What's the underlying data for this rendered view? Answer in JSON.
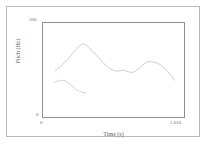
{
  "chart_data": {
    "type": "line",
    "title": "",
    "subtitle": "",
    "xlabel": "Time (s)",
    "ylabel": "Pitch (Hz)",
    "xlim": [
      0,
      1.616
    ],
    "ylim": [
      0,
      300
    ],
    "xticks": [
      "0",
      "1.616"
    ],
    "yticks": [
      "0",
      "300"
    ],
    "grid": false,
    "legend": null,
    "annotations": [],
    "series": [
      {
        "name": "pitch-contour-main",
        "color": "#c9c9cd",
        "x": [
          0.15,
          0.2,
          0.25,
          0.3,
          0.34,
          0.38,
          0.42,
          0.46,
          0.5,
          0.54,
          0.58,
          0.62,
          0.66,
          0.7,
          0.74,
          0.78,
          0.82,
          0.86,
          0.9,
          0.94,
          0.98,
          1.02,
          1.06,
          1.1,
          1.14,
          1.18,
          1.22,
          1.26,
          1.3,
          1.34,
          1.38,
          1.42,
          1.46,
          1.5
        ],
        "y": [
          150,
          158,
          172,
          186,
          200,
          213,
          225,
          232,
          228,
          218,
          206,
          194,
          182,
          170,
          160,
          152,
          148,
          146,
          150,
          148,
          144,
          142,
          146,
          156,
          166,
          174,
          177,
          174,
          172,
          166,
          156,
          146,
          132,
          118
        ]
      },
      {
        "name": "pitch-contour-secondary",
        "color": "#cfcfd3",
        "x": [
          0.14,
          0.18,
          0.22,
          0.26,
          0.3,
          0.34,
          0.38,
          0.42,
          0.46,
          0.5
        ],
        "y": [
          112,
          116,
          118,
          116,
          110,
          100,
          90,
          84,
          80,
          79
        ]
      }
    ]
  }
}
